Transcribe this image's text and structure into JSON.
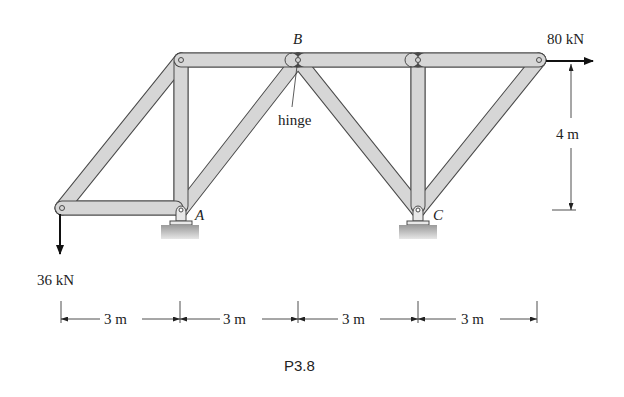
{
  "figure": {
    "caption": "P3.8",
    "labels": {
      "node_a": "A",
      "node_b": "B",
      "node_c": "C",
      "hinge": "hinge"
    },
    "loads": {
      "horizontal": "80 kN",
      "vertical": "36 kN"
    },
    "dimensions": {
      "height": "4 m",
      "spans": [
        "3 m",
        "3 m",
        "3 m",
        "3 m"
      ]
    },
    "colors": {
      "member_fill": "#d4d4d4",
      "member_stroke": "#4a4a4a",
      "text": "#222222"
    }
  }
}
